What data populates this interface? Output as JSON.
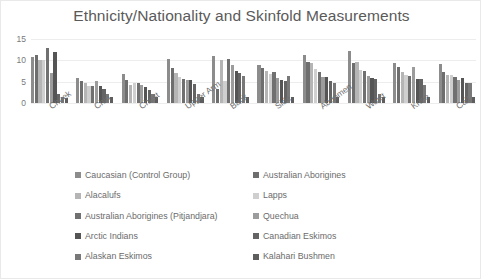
{
  "chart_data": {
    "type": "bar",
    "title": "Ethnicity/Nationality and Skinfold Measurements",
    "xlabel": "",
    "ylabel": "",
    "ylim": [
      0,
      15
    ],
    "yticks": [
      0,
      5,
      10,
      15
    ],
    "grid": true,
    "legend_position": "bottom",
    "categories": [
      "Cheek",
      "Chin",
      "Chest",
      "Upper Arm",
      "Back",
      "Side",
      "Abdomen",
      "Waist",
      "Knee",
      "Calf"
    ],
    "series": [
      {
        "name": "Caucasian (Control Group)",
        "color": "#8c8c8c",
        "values": [
          10.8,
          5.9,
          6.8,
          10.2,
          11.1,
          9.0,
          11.2,
          12.3,
          9.4,
          9.2
        ]
      },
      {
        "name": "Australian Aborigines",
        "color": "#6e6e6e",
        "values": [
          11.3,
          5.1,
          5.5,
          8.1,
          3.2,
          8.2,
          9.5,
          9.4,
          8.5,
          7.2
        ]
      },
      {
        "name": "Alacalufs",
        "color": "#b5b5b5",
        "values": [
          10.0,
          4.7,
          4.3,
          7.0,
          10.1,
          7.6,
          9.3,
          9.6,
          7.2,
          6.5
        ]
      },
      {
        "name": "Lapps",
        "color": "#cfcfcf",
        "values": [
          10.1,
          4.1,
          4.6,
          6.0,
          5.1,
          6.9,
          8.0,
          7.7,
          6.6,
          6.6
        ]
      },
      {
        "name": "Australian Aborigines (Pitjandjara)",
        "color": "#707070",
        "values": [
          13.0,
          4.0,
          4.8,
          5.6,
          10.2,
          7.3,
          7.2,
          7.6,
          6.4,
          6.2
        ]
      },
      {
        "name": "Quechua",
        "color": "#9c9c9c",
        "values": [
          7.0,
          5.1,
          4.2,
          5.4,
          9.0,
          5.9,
          6.2,
          6.4,
          8.5,
          5.4
        ]
      },
      {
        "name": "Arctic Indians",
        "color": "#555555",
        "values": [
          11.9,
          4.1,
          3.8,
          5.3,
          7.4,
          5.4,
          6.0,
          5.8,
          5.7,
          5.9
        ]
      },
      {
        "name": "Canadian Eskimos",
        "color": "#646464",
        "values": [
          2.0,
          3.3,
          3.1,
          4.4,
          7.0,
          5.2,
          5.1,
          5.6,
          5.6,
          4.8
        ]
      },
      {
        "name": "Alaskan Eskimos",
        "color": "#787878",
        "values": [
          1.5,
          2.0,
          2.0,
          2.0,
          6.4,
          6.3,
          4.7,
          2.0,
          4.3,
          4.7
        ]
      },
      {
        "name": "Kalahari Bushmen",
        "color": "#5e5e5e",
        "values": [
          1.2,
          1.5,
          1.5,
          1.5,
          1.5,
          1.5,
          1.5,
          1.5,
          1.5,
          1.5
        ]
      }
    ]
  },
  "legend": {
    "rows": [
      {
        "left": "Caucasian (Control Group)",
        "right": "Australian Aborigines"
      },
      {
        "left": "Alacalufs",
        "right": "Lapps"
      },
      {
        "left": "Australian Aborigines (Pitjandjara)",
        "right": "Quechua"
      },
      {
        "left": "Arctic Indians",
        "right": "Canadian Eskimos"
      },
      {
        "left": "Alaskan Eskimos",
        "right": "Kalahari Bushmen"
      }
    ]
  }
}
